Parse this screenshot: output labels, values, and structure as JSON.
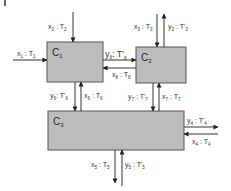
{
  "diagram": {
    "type": "process-flow",
    "nodes": [
      {
        "id": "C1",
        "label": "C",
        "sub": "1",
        "x": 47,
        "y": 42,
        "w": 56,
        "h": 40
      },
      {
        "id": "C2",
        "label": "C",
        "sub": "2",
        "x": 136,
        "y": 47,
        "w": 50,
        "h": 36
      },
      {
        "id": "C3",
        "label": "C",
        "sub": "3",
        "x": 48,
        "y": 111,
        "w": 136,
        "h": 39
      }
    ],
    "streams": [
      {
        "id": "s1",
        "var": "x",
        "vsub": "1",
        "temp": "T",
        "tsub": "1",
        "prime": false,
        "to": "C1",
        "direction": "in"
      },
      {
        "id": "s2",
        "var": "x",
        "vsub": "2",
        "temp": "T",
        "tsub": "2",
        "prime": false,
        "to": "C1",
        "direction": "in"
      },
      {
        "id": "s3",
        "var": "x",
        "vsub": "3",
        "temp": "T",
        "tsub": "3",
        "prime": false,
        "to": "C2",
        "direction": "in"
      },
      {
        "id": "s3p",
        "var": "y",
        "vsub": "3",
        "temp": "T'",
        "tsub": "3",
        "prime": true,
        "from": "C2",
        "direction": "out"
      },
      {
        "id": "s8p",
        "var": "y",
        "vsub": "8",
        "temp": "T'",
        "tsub": "8",
        "prime": true,
        "from": "C1",
        "to": "C2"
      },
      {
        "id": "s8",
        "var": "x",
        "vsub": "8",
        "temp": "T",
        "tsub": "8",
        "prime": false,
        "from": "C2",
        "to": "C1"
      },
      {
        "id": "s6p",
        "var": "y",
        "vsub": "6",
        "temp": "T'",
        "tsub": "6",
        "prime": true,
        "from": "C1",
        "to": "C3"
      },
      {
        "id": "s6",
        "var": "x",
        "vsub": "6",
        "temp": "T",
        "tsub": "6",
        "prime": false,
        "from": "C3",
        "to": "C1"
      },
      {
        "id": "s7p",
        "var": "y",
        "vsub": "7",
        "temp": "T'",
        "tsub": "7",
        "prime": true,
        "from": "C2",
        "to": "C3"
      },
      {
        "id": "s7",
        "var": "x",
        "vsub": "7",
        "temp": "T",
        "tsub": "7",
        "prime": false,
        "from": "C3",
        "to": "C2"
      },
      {
        "id": "s4p",
        "var": "y",
        "vsub": "4",
        "temp": "T'",
        "tsub": "4",
        "prime": true,
        "from": "C3",
        "direction": "out"
      },
      {
        "id": "s4",
        "var": "x",
        "vsub": "4",
        "temp": "T",
        "tsub": "4",
        "prime": false,
        "to": "C3",
        "direction": "in"
      },
      {
        "id": "s5",
        "var": "x",
        "vsub": "5",
        "temp": "T",
        "tsub": "5",
        "prime": false,
        "from": "C3",
        "direction": "out"
      },
      {
        "id": "s5p",
        "var": "y",
        "vsub": "5",
        "temp": "T'",
        "tsub": "5",
        "prime": true,
        "to": "C3",
        "direction": "in"
      }
    ]
  },
  "labels": {
    "c1": {
      "main": "C",
      "sub": "1"
    },
    "c2": {
      "main": "C",
      "sub": "2"
    },
    "c3": {
      "main": "C",
      "sub": "3"
    },
    "x1": {
      "v": "x",
      "vs": "1",
      "sep": " : ",
      "t": "T",
      "ts": "1"
    },
    "x2": {
      "v": "x",
      "vs": "2",
      "sep": " : ",
      "t": "T",
      "ts": "2"
    },
    "x3": {
      "v": "x",
      "vs": "3",
      "sep": " : ",
      "t": "T",
      "ts": "3"
    },
    "y3": {
      "v": "y",
      "vs": "3",
      "sep": " : ",
      "t": "T'",
      "ts": "3"
    },
    "y8": {
      "v": "y",
      "vs": "8",
      "sep": ": ",
      "t": "T'",
      "ts": "8"
    },
    "x8": {
      "v": "x",
      "vs": "8",
      "sep": " : ",
      "t": "T",
      "ts": "8"
    },
    "y6": {
      "v": "y",
      "vs": "6",
      "sep": ": ",
      "t": "T'",
      "ts": "6"
    },
    "x6": {
      "v": "x",
      "vs": "6",
      "sep": " : ",
      "t": "T",
      "ts": "6"
    },
    "y7": {
      "v": "y",
      "vs": "7",
      "sep": " : ",
      "t": "T'",
      "ts": "7"
    },
    "x7": {
      "v": "x",
      "vs": "7",
      "sep": " : ",
      "t": "T",
      "ts": "7"
    },
    "y4": {
      "v": "y",
      "vs": "4",
      "sep": " : ",
      "t": "T'",
      "ts": "4"
    },
    "x4": {
      "v": "x",
      "vs": "4",
      "sep": " : ",
      "t": "T",
      "ts": "4"
    },
    "x5": {
      "v": "x",
      "vs": "5",
      "sep": " : ",
      "t": "T",
      "ts": "5"
    },
    "y5": {
      "v": "y",
      "vs": "5",
      "sep": " : ",
      "t": "T'",
      "ts": "5"
    }
  },
  "colors": {
    "box_fill": "#bdbdbd",
    "box_stroke": "#555555",
    "line": "#333333",
    "text": "#333333"
  }
}
